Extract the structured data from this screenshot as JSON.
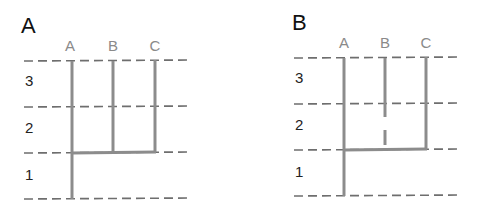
{
  "panels": [
    {
      "label": "A",
      "columns": [
        "A",
        "B",
        "C"
      ],
      "rows": [
        "3",
        "2",
        "1"
      ],
      "description": "Lineages B and C branch from A at level 1/2 boundary; B continuous through row 2 and 3"
    },
    {
      "label": "B",
      "columns": [
        "A",
        "B",
        "C"
      ],
      "rows": [
        "3",
        "2",
        "1"
      ],
      "description": "Lineage B has a gap in row 2 (discontinuous range)"
    }
  ],
  "colors": {
    "line": "#8c8c8c",
    "dash": "#6e6e6e",
    "column_label": "#8a8a8a",
    "panel_label": "#111111"
  }
}
